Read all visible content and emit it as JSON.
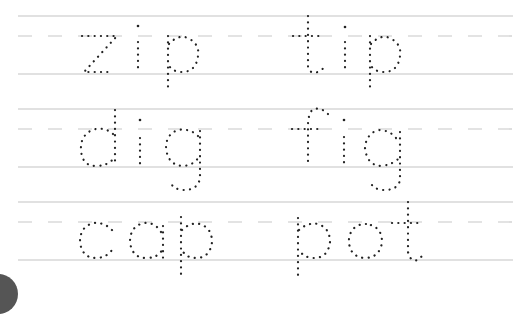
{
  "worksheet": {
    "type": "tracing-practice",
    "rows": [
      {
        "words": [
          {
            "text": "zip"
          },
          {
            "text": "tip"
          }
        ]
      },
      {
        "words": [
          {
            "text": "dig"
          },
          {
            "text": "fig"
          }
        ]
      },
      {
        "words": [
          {
            "text": "cap"
          },
          {
            "text": "pot"
          }
        ]
      }
    ],
    "colors": {
      "guide_line": "#c4c4c4",
      "trace_dots": "#222222",
      "corner_circle": "#555555"
    }
  }
}
